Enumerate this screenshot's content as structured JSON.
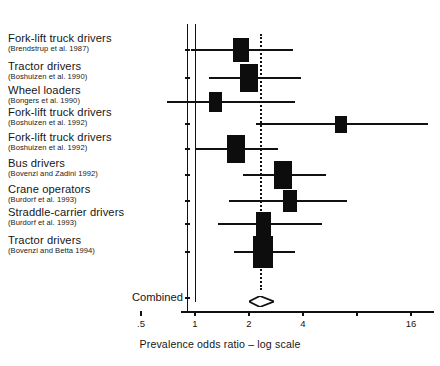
{
  "figure": {
    "x_axis_title": "Prevalence odds ratio – log scale",
    "combined_label": "Combined"
  },
  "chart_data": {
    "type": "forest",
    "title": "",
    "xlabel": "Prevalence odds ratio – log scale",
    "ylabel": "",
    "x_scale": "log",
    "xlim": [
      0.5,
      20
    ],
    "grid": false,
    "legend": null,
    "null_value": 1,
    "summary_value": 2.3,
    "tick_labels": [
      ".5",
      "1",
      "2",
      "4",
      "16"
    ],
    "tick_values": [
      0.5,
      1,
      2,
      4,
      16
    ],
    "studies": [
      {
        "occupation": "Fork-lift truck drivers",
        "citation": "(Brendstrup et al. 1987)",
        "or": 1.8,
        "ci_low": 0.95,
        "ci_high": 3.5,
        "weight_box": 1.0
      },
      {
        "occupation": "Tractor drivers",
        "citation": "(Boshuizen et al. 1990)",
        "or": 2.0,
        "ci_low": 1.2,
        "ci_high": 3.9,
        "weight_box": 1.35
      },
      {
        "occupation": "Wheel loaders",
        "citation": "(Bongers et al. 1990)",
        "or": 1.3,
        "ci_low": 0.7,
        "ci_high": 3.6,
        "weight_box": 0.65
      },
      {
        "occupation": "Fork-lift truck drivers",
        "citation": "(Boshuizen et al. 1992)",
        "or": 6.5,
        "ci_low": 2.2,
        "ci_high": 20.0,
        "weight_box": 0.5
      },
      {
        "occupation": "Fork-lift truck drivers",
        "citation": "(Boshuizen et al. 1992)",
        "or": 1.7,
        "ci_low": 1.0,
        "ci_high": 2.9,
        "weight_box": 1.3
      },
      {
        "occupation": "Bus drivers",
        "citation": "(Bovenzi and Zadini 1992)",
        "or": 3.1,
        "ci_low": 1.85,
        "ci_high": 5.4,
        "weight_box": 1.25
      },
      {
        "occupation": "Crane operators",
        "citation": "(Burdorf et al. 1993)",
        "or": 3.4,
        "ci_low": 1.55,
        "ci_high": 7.0,
        "weight_box": 0.8
      },
      {
        "occupation": "Straddle-carrier drivers",
        "citation": "(Burdorf et al. 1993)",
        "or": 2.4,
        "ci_low": 1.35,
        "ci_high": 5.1,
        "weight_box": 0.95
      },
      {
        "occupation": "Tractor drivers",
        "citation": "(Bovenzi and Betta 1994)",
        "or": 2.4,
        "ci_low": 1.65,
        "ci_high": 3.6,
        "weight_box": 1.6
      }
    ],
    "combined": {
      "label": "Combined",
      "or": 2.3,
      "ci_low": 2.0,
      "ci_high": 2.75
    }
  }
}
